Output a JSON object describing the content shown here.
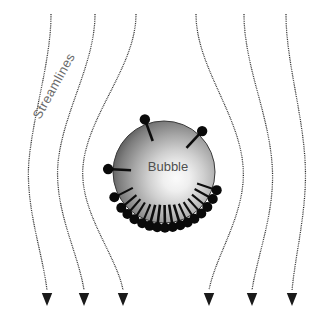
{
  "figure": {
    "title_visible": false,
    "labels": {
      "streamlines": "Streamlines",
      "bubble": "Bubble"
    },
    "colors": {
      "background": "#ffffff",
      "streamline": "#2b2b2b",
      "arrow": "#1a1a1a",
      "surfactant": "#0a0a0a",
      "bubble_edge": "#3a3a3a",
      "bubble_highlight": "#fbfbfb",
      "bubble_shadow": "#2e2e2e",
      "bubble_label_text": "#4f4f4f",
      "streamlines_label_text": "#6a6a6a"
    },
    "bubble": {
      "center_x": 164,
      "center_y": 172,
      "radius": 51,
      "highlight_x": 178,
      "highlight_y": 176,
      "label": "Bubble",
      "label_x": 168,
      "label_y": 168
    },
    "streamlines_label_transform": {
      "x": 40,
      "y": 120,
      "rotation_deg": -61
    },
    "streamlines": [
      {
        "id": "streamline-1",
        "top_x": 51,
        "mid_x": 29,
        "bottom_x": 47,
        "path": "M 51 14 C 51 60, 34 110, 29 160 C 25 206, 42 250, 47 290"
      },
      {
        "id": "streamline-2",
        "top_x": 95,
        "mid_x": 58,
        "bottom_x": 84,
        "path": "M 95 14 C 95 64, 63 112, 58 163 C 54 210, 78 252, 84 290"
      },
      {
        "id": "streamline-3",
        "top_x": 136,
        "mid_x": 83,
        "bottom_x": 123,
        "path": "M 136 14 C 136 66, 88 114, 83 166 C 79 212, 116 254, 123 290"
      },
      {
        "id": "streamline-4",
        "top_x": 196,
        "mid_x": 243,
        "bottom_x": 209,
        "path": "M 196 14 C 196 66, 239 114, 243 166 C 247 212, 216 254, 209 290"
      },
      {
        "id": "streamline-5",
        "top_x": 244,
        "mid_x": 272,
        "bottom_x": 252,
        "path": "M 244 14 C 244 64, 268 112, 272 163 C 276 210, 258 252, 252 290"
      },
      {
        "id": "streamline-6",
        "top_x": 286,
        "mid_x": 305,
        "bottom_x": 292,
        "path": "M 286 14 C 286 60, 302 110, 305 160 C 308 206, 296 250, 292 290"
      }
    ],
    "arrow_heads": [
      {
        "id": "arrow-1",
        "x": 47,
        "y": 306
      },
      {
        "id": "arrow-2",
        "x": 84,
        "y": 306
      },
      {
        "id": "arrow-3",
        "x": 123,
        "y": 306
      },
      {
        "id": "arrow-4",
        "x": 209,
        "y": 306
      },
      {
        "id": "arrow-5",
        "x": 252,
        "y": 306
      },
      {
        "id": "arrow-6",
        "x": 292,
        "y": 306
      }
    ],
    "surfactants": [
      {
        "id": "surfactant-1",
        "angle_deg": 250,
        "tail_len": 18,
        "head_r": 5.2
      },
      {
        "id": "surfactant-2",
        "angle_deg": 313,
        "tail_len": 18,
        "head_r": 5.2
      },
      {
        "id": "surfactant-3",
        "angle_deg": 183,
        "tail_len": 18,
        "head_r": 5.2
      },
      {
        "id": "surfactant-4",
        "angle_deg": 153,
        "tail_len": 16,
        "head_r": 5.0
      },
      {
        "id": "surfactant-5",
        "angle_deg": 140,
        "tail_len": 15,
        "head_r": 5.0
      },
      {
        "id": "surfactant-6",
        "angle_deg": 131,
        "tail_len": 15,
        "head_r": 5.0
      },
      {
        "id": "surfactant-7",
        "angle_deg": 122,
        "tail_len": 15,
        "head_r": 5.0
      },
      {
        "id": "surfactant-8",
        "angle_deg": 113,
        "tail_len": 16,
        "head_r": 5.0
      },
      {
        "id": "surfactant-9",
        "angle_deg": 105,
        "tail_len": 17,
        "head_r": 5.0
      },
      {
        "id": "surfactant-10",
        "angle_deg": 97,
        "tail_len": 18,
        "head_r": 5.0
      },
      {
        "id": "surfactant-11",
        "angle_deg": 89,
        "tail_len": 18,
        "head_r": 5.0
      },
      {
        "id": "surfactant-12",
        "angle_deg": 81,
        "tail_len": 18,
        "head_r": 5.0
      },
      {
        "id": "surfactant-13",
        "angle_deg": 73,
        "tail_len": 17,
        "head_r": 5.0
      },
      {
        "id": "surfactant-14",
        "angle_deg": 65,
        "tail_len": 16,
        "head_r": 5.0
      },
      {
        "id": "surfactant-15",
        "angle_deg": 57,
        "tail_len": 15,
        "head_r": 5.0
      },
      {
        "id": "surfactant-16",
        "angle_deg": 48,
        "tail_len": 15,
        "head_r": 5.0
      },
      {
        "id": "surfactant-17",
        "angle_deg": 39,
        "tail_len": 15,
        "head_r": 5.0
      },
      {
        "id": "surfactant-18",
        "angle_deg": 29,
        "tail_len": 16,
        "head_r": 5.0
      },
      {
        "id": "surfactant-19",
        "angle_deg": 19,
        "tail_len": 16,
        "head_r": 5.0
      }
    ]
  }
}
